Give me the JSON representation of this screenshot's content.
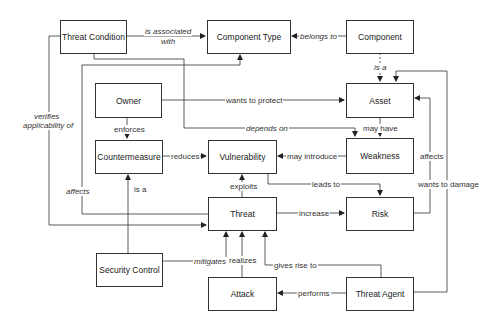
{
  "diagram": {
    "nodes": {
      "threat_condition": "Threat Condition",
      "component_type": "Component Type",
      "component": "Component",
      "owner": "Owner",
      "asset": "Asset",
      "countermeasure": "Countermeasure",
      "vulnerability": "Vulnerability",
      "weakness": "Weakness",
      "threat": "Threat",
      "risk": "Risk",
      "security_control": "Security Control",
      "attack": "Attack",
      "threat_agent": "Threat Agent"
    },
    "edges": {
      "is_associated_with_1": "is associated",
      "is_associated_with_2": "with",
      "belongs_to": "belongs to",
      "is_a_component": "is a",
      "wants_to_protect": "wants to protect",
      "depends_on": "depends on",
      "may_have": "may have",
      "enforces": "enforces",
      "reduces": "reduces",
      "may_introduce": "may introduce",
      "verifies_1": "verifies",
      "verifies_2": "applicability of",
      "affects_left": "affects",
      "is_a_control": "is a",
      "exploits": "exploits",
      "leads_to": "leads to",
      "affects_right": "affects",
      "wants_to_damage": "wants to damage",
      "increase": "increase",
      "mitigates": "mitigates",
      "realizes": "realizes",
      "gives_rise_to": "gives rise to",
      "performs": "performs"
    }
  }
}
